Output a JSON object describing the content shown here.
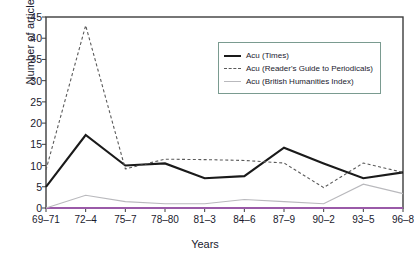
{
  "chart_data": {
    "type": "line",
    "title": "",
    "xlabel": "Years",
    "ylabel": "Number of articles",
    "categories": [
      "69–71",
      "72–4",
      "75–7",
      "78–80",
      "81–3",
      "84–6",
      "87–9",
      "90–2",
      "93–5",
      "96–8"
    ],
    "ylim": [
      0,
      45
    ],
    "yticks": [
      0,
      5,
      10,
      15,
      20,
      25,
      30,
      35,
      40,
      45
    ],
    "ytick_labels": [
      "0",
      "5",
      "10",
      "15",
      "20",
      "25",
      "30",
      "35",
      "40",
      "45"
    ],
    "grid": false,
    "legend_position": "upper right",
    "series": [
      {
        "name": "Acu (Times)",
        "style": "solid",
        "color": "#1a1a1a",
        "values": [
          5,
          17.2,
          10,
          10.5,
          7,
          7.5,
          14.2,
          10.5,
          7,
          8.4
        ]
      },
      {
        "name": "Acu (Reader's Guide to Periodicals)",
        "style": "dashed",
        "color": "#5a5a5a",
        "values": [
          9,
          43,
          9.2,
          11.5,
          11.4,
          11.2,
          10.6,
          4.8,
          10.6,
          8.4
        ]
      },
      {
        "name": "Acu (British Humanities Index)",
        "style": "thin",
        "color": "#b9b9bd",
        "values": [
          0,
          3,
          1.5,
          1,
          1,
          2,
          1.5,
          1,
          5.6,
          3.4
        ]
      }
    ]
  },
  "axes": {
    "frame_color": "#3d3d3d",
    "baseline_color": "#9a5aa8"
  }
}
